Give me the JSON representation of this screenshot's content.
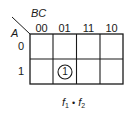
{
  "kmap": {
    "row_variable": "A",
    "column_variable": "BC",
    "column_headers": [
      "00",
      "01",
      "11",
      "10"
    ],
    "row_headers": [
      "0",
      "1"
    ],
    "cells": [
      [
        "",
        "",
        "",
        ""
      ],
      [
        "",
        "1",
        "",
        ""
      ]
    ],
    "circled_cells": [
      {
        "row": 1,
        "col": 1,
        "value": "1"
      }
    ]
  },
  "caption": {
    "f1": "f",
    "f1_sub": "1",
    "operator": "•",
    "f2": "f",
    "f2_sub": "2"
  },
  "colors": {
    "line": "#1a1a1a",
    "background": "#ffffff"
  }
}
